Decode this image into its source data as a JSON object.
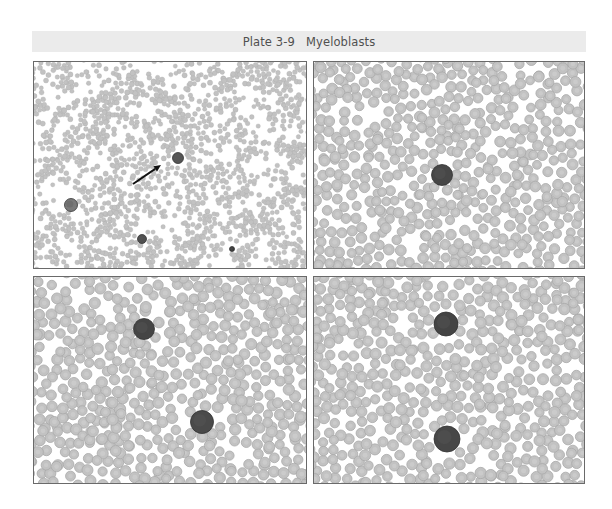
{
  "plate": {
    "title": "Plate 3-9   Myeloblasts",
    "banner_color": "#ebebeb",
    "text_color": "#505050"
  },
  "colors": {
    "rbc_fill": "#c2c2c2",
    "rbc_edge": "#a9a9a9",
    "rbc_center": "#cfcfcf",
    "blast_fill": "#474747",
    "blast_edge": "#333333",
    "border": "#6a6a6a",
    "arrow": "#111111"
  },
  "panels": [
    {
      "id": "top-left",
      "label": "Low-power field with arrow indicating myeloblast",
      "x": 33,
      "y": 61,
      "w": 274,
      "h": 208,
      "rbc_radius": 2.4,
      "rbc_count": 1700,
      "seed": 11,
      "blasts": [
        {
          "cx": 144,
          "cy": 96,
          "r": 5.5,
          "fill": "#555555"
        },
        {
          "cx": 37,
          "cy": 143,
          "r": 6.5,
          "fill": "#7a7a7a"
        },
        {
          "cx": 108,
          "cy": 177,
          "r": 4.5,
          "fill": "#505050"
        },
        {
          "cx": 198,
          "cy": 187,
          "r": 2.5,
          "fill": "#3c3c3c"
        }
      ],
      "arrow": {
        "x1": 99,
        "y1": 122,
        "x2": 127,
        "y2": 103
      }
    },
    {
      "id": "top-right",
      "label": "Myeloblast among red cells",
      "x": 313,
      "y": 61,
      "w": 272,
      "h": 208,
      "rbc_radius": 5.0,
      "rbc_count": 560,
      "seed": 23,
      "blasts": [
        {
          "cx": 128,
          "cy": 113,
          "r": 10.5,
          "fill": "#474747"
        }
      ],
      "arrow": null
    },
    {
      "id": "bottom-left",
      "label": "Two myeloblasts",
      "x": 33,
      "y": 276,
      "w": 274,
      "h": 208,
      "rbc_radius": 5.2,
      "rbc_count": 540,
      "seed": 37,
      "blasts": [
        {
          "cx": 110,
          "cy": 52,
          "r": 10.5,
          "fill": "#454545"
        },
        {
          "cx": 168,
          "cy": 145,
          "r": 11.5,
          "fill": "#4a4a4a"
        }
      ],
      "arrow": null
    },
    {
      "id": "bottom-right",
      "label": "Two myeloblasts",
      "x": 313,
      "y": 276,
      "w": 272,
      "h": 208,
      "rbc_radius": 5.2,
      "rbc_count": 520,
      "seed": 53,
      "blasts": [
        {
          "cx": 132,
          "cy": 47,
          "r": 12,
          "fill": "#444444"
        },
        {
          "cx": 133,
          "cy": 162,
          "r": 13,
          "fill": "#474747"
        }
      ],
      "arrow": null
    }
  ]
}
